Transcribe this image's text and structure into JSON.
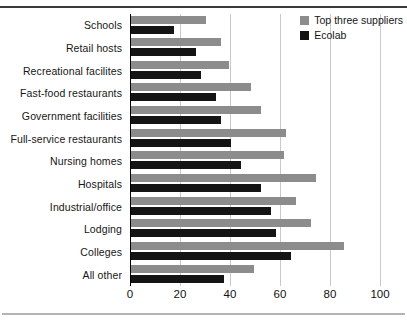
{
  "chart_data": {
    "type": "bar",
    "orientation": "horizontal",
    "title": "",
    "subtitle": "",
    "xlabel": "",
    "ylabel": "",
    "xlim": [
      0,
      100
    ],
    "xticks": [
      0,
      20,
      40,
      60,
      80,
      100
    ],
    "grid": "vertical",
    "legend_position": "top-right",
    "categories": [
      "Schools",
      "Retail hosts",
      "Recreational facilites",
      "Fast-food restaurants",
      "Government facilities",
      "Full-service restaurants",
      "Nursing homes",
      "Hospitals",
      "Industrial/office",
      "Lodging",
      "Colleges",
      "All other"
    ],
    "series": [
      {
        "name": "Top three suppliers",
        "color": "#8c8c8c",
        "values": [
          30,
          36,
          39,
          48,
          52,
          62,
          61,
          74,
          66,
          72,
          85,
          49
        ]
      },
      {
        "name": "Ecolab",
        "color": "#141414",
        "values": [
          17,
          26,
          28,
          34,
          36,
          40,
          44,
          52,
          56,
          58,
          64,
          37
        ]
      }
    ]
  },
  "legend": {
    "items": [
      {
        "label": "Top three suppliers",
        "color": "#8c8c8c"
      },
      {
        "label": "Ecolab",
        "color": "#141414"
      }
    ]
  }
}
